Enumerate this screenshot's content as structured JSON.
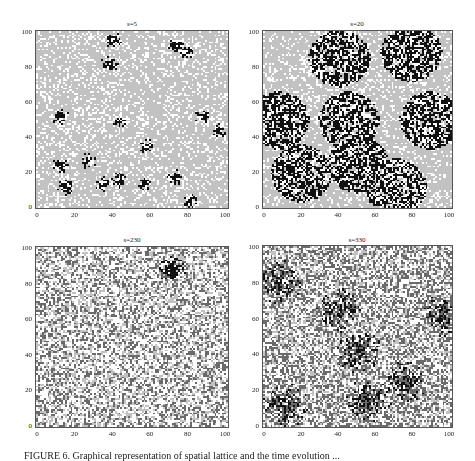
{
  "figure": {
    "caption": "FIGURE 6. Graphical representation of spatial lattice and the time evolution ..."
  },
  "chart_data": [
    {
      "type": "heatmap",
      "title": "s=5",
      "xlim": [
        0,
        100
      ],
      "ylim": [
        0,
        100
      ],
      "xticks": [
        "0",
        "20",
        "40",
        "60",
        "80",
        "100"
      ],
      "yticks": [
        "0",
        "20",
        "40",
        "60",
        "80",
        "100"
      ],
      "states": [
        "white",
        "light-gray",
        "dark-gray",
        "black"
      ],
      "background": "light-gray with scattered white cells",
      "clusters": [
        [
          40,
          95
        ],
        [
          38,
          82
        ],
        [
          73,
          93
        ],
        [
          78,
          88
        ],
        [
          87,
          52
        ],
        [
          95,
          44
        ],
        [
          12,
          52
        ],
        [
          43,
          50
        ],
        [
          57,
          35
        ],
        [
          27,
          27
        ],
        [
          12,
          24
        ],
        [
          15,
          12
        ],
        [
          35,
          14
        ],
        [
          43,
          16
        ],
        [
          56,
          14
        ],
        [
          72,
          18
        ],
        [
          80,
          4
        ]
      ]
    },
    {
      "type": "heatmap",
      "title": "s=20",
      "xlim": [
        0,
        100
      ],
      "ylim": [
        0,
        100
      ],
      "xticks": [
        "0",
        "20",
        "40",
        "60",
        "80",
        "100"
      ],
      "yticks": [
        "0",
        "20",
        "40",
        "60",
        "80",
        "100"
      ],
      "background": "light-gray with large black/white clusters",
      "clusters": [
        [
          40,
          85
        ],
        [
          78,
          88
        ],
        [
          8,
          50
        ],
        [
          45,
          50
        ],
        [
          88,
          50
        ],
        [
          20,
          20
        ],
        [
          50,
          25
        ],
        [
          70,
          12
        ]
      ]
    },
    {
      "type": "heatmap",
      "title": "s=230",
      "xlim": [
        0,
        100
      ],
      "ylim": [
        0,
        100
      ],
      "xticks": [
        "0",
        "20",
        "40",
        "60",
        "80",
        "100"
      ],
      "yticks": [
        "0",
        "20",
        "40",
        "60",
        "80",
        "100"
      ],
      "background": "mixed white, light-gray and dark-gray noise",
      "clusters": [
        [
          70,
          88
        ]
      ]
    },
    {
      "type": "heatmap",
      "title": "s=330",
      "xlim": [
        0,
        100
      ],
      "ylim": [
        0,
        100
      ],
      "xticks": [
        "0",
        "20",
        "40",
        "60",
        "80",
        "100"
      ],
      "yticks": [
        "0",
        "20",
        "40",
        "60",
        "80",
        "100"
      ],
      "background": "mixed noise with dark-gray/black bands",
      "clusters": [
        [
          8,
          80
        ],
        [
          40,
          65
        ],
        [
          50,
          42
        ],
        [
          95,
          62
        ],
        [
          75,
          25
        ],
        [
          12,
          12
        ],
        [
          55,
          15
        ]
      ]
    }
  ],
  "colors": {
    "white": "#ffffff",
    "light": "#c2c2c2",
    "dark": "#6a6a6a",
    "black": "#111111",
    "frame": "#555555"
  }
}
